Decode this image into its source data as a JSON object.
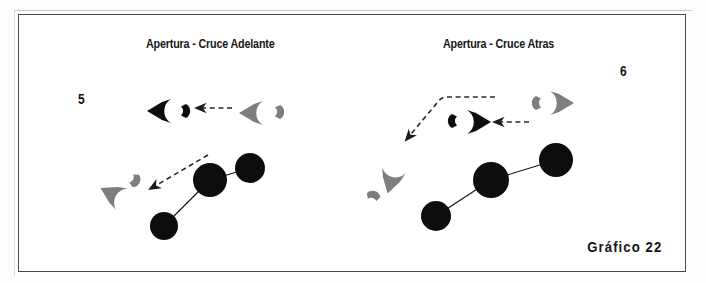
{
  "figure": {
    "caption": "Gráfico 22",
    "border_color": "#4a4a4a",
    "background_color": "#ffffff",
    "ink_dark_color": "#0d0d0d",
    "ink_gray_color": "#7e7e7e",
    "dash_color": "#2a2a2a"
  },
  "panels": [
    {
      "id": "left",
      "title": "Apertura - Cruce Adelante",
      "number": "5",
      "title_pos": {
        "x": 146,
        "y": 44
      },
      "number_pos": {
        "x": 78,
        "y": 98
      },
      "players_dark": [
        {
          "name": "player-dark-wedge-left-top",
          "cx": 160,
          "cy": 111,
          "r": 13,
          "facing": "left"
        },
        {
          "name": "player-dark-crescent-top",
          "cx": 184,
          "cy": 111,
          "r": 6,
          "facing": "left"
        }
      ],
      "players_gray": [
        {
          "name": "player-gray-wedge-top",
          "cx": 252,
          "cy": 113,
          "r": 12,
          "facing": "left"
        },
        {
          "name": "player-gray-crescent-top",
          "cx": 280,
          "cy": 112,
          "r": 6,
          "facing": "left"
        },
        {
          "name": "player-gray-wedge-lower",
          "cx": 112,
          "cy": 193,
          "r": 13,
          "facing": "upleft"
        },
        {
          "name": "player-gray-crescent-lower",
          "cx": 133,
          "cy": 179,
          "r": 6,
          "facing": "upleft"
        }
      ],
      "ball_nodes": [
        {
          "name": "ball-node-a",
          "cx": 164,
          "cy": 226,
          "r": 14
        },
        {
          "name": "ball-node-b",
          "cx": 210,
          "cy": 180,
          "r": 17
        },
        {
          "name": "ball-node-c",
          "cx": 250,
          "cy": 168,
          "r": 15
        }
      ],
      "ball_links": [
        {
          "name": "ball-link-a-b",
          "x1": 164,
          "y1": 226,
          "x2": 210,
          "y2": 180
        },
        {
          "name": "ball-link-b-c",
          "x1": 210,
          "y1": 180,
          "x2": 250,
          "y2": 168
        }
      ],
      "arrows": [
        {
          "name": "arrow-horizontal-top",
          "points": "232,108 196,108",
          "head": "left"
        },
        {
          "name": "arrow-diagonal-lower",
          "points": "208,155 148,190",
          "head": "downleft"
        }
      ]
    },
    {
      "id": "right",
      "title": "Apertura - Cruce Atras",
      "number": "6",
      "title_pos": {
        "x": 443,
        "y": 44
      },
      "number_pos": {
        "x": 620,
        "y": 70
      },
      "players_dark": [
        {
          "name": "player-dark-wedge-center",
          "cx": 478,
          "cy": 122,
          "r": 13,
          "facing": "right"
        },
        {
          "name": "player-dark-crescent-center",
          "cx": 453,
          "cy": 121,
          "r": 6,
          "facing": "right"
        }
      ],
      "players_gray": [
        {
          "name": "player-gray-wedge-top",
          "cx": 561,
          "cy": 103,
          "r": 12,
          "facing": "right"
        },
        {
          "name": "player-gray-crescent-top",
          "cx": 538,
          "cy": 103,
          "r": 6,
          "facing": "right"
        },
        {
          "name": "player-gray-wedge-lower",
          "cx": 391,
          "cy": 180,
          "r": 13,
          "facing": "down"
        },
        {
          "name": "player-gray-crescent-lower",
          "cx": 372,
          "cy": 197,
          "r": 6,
          "facing": "down"
        }
      ],
      "ball_nodes": [
        {
          "name": "ball-node-a",
          "cx": 436,
          "cy": 216,
          "r": 15
        },
        {
          "name": "ball-node-b",
          "cx": 491,
          "cy": 180,
          "r": 18
        },
        {
          "name": "ball-node-c",
          "cx": 556,
          "cy": 160,
          "r": 17
        }
      ],
      "ball_links": [
        {
          "name": "ball-link-a-b",
          "x1": 436,
          "y1": 216,
          "x2": 491,
          "y2": 180
        },
        {
          "name": "ball-link-b-c",
          "x1": 491,
          "y1": 180,
          "x2": 556,
          "y2": 160
        }
      ],
      "arrows": [
        {
          "name": "arrow-horizontal-center",
          "points": "529,122 492,122",
          "head": "left"
        },
        {
          "name": "arrow-elbow-lower-left",
          "points": "495,97 443,97 404,142",
          "head": "downleft"
        }
      ]
    }
  ]
}
